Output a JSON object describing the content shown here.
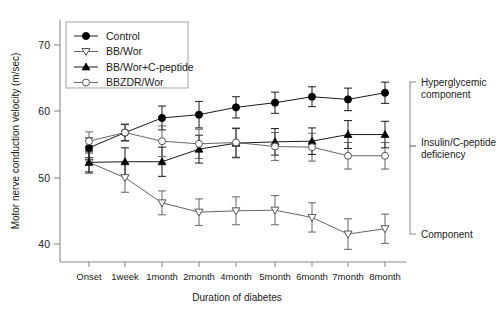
{
  "chart_data": {
    "type": "line",
    "title": "",
    "xlabel": "Duration of diabetes",
    "ylabel": "Motor nerve conduction velocity (m/sec)",
    "categories": [
      "Onset",
      "1week",
      "1month",
      "2month",
      "4month",
      "5month",
      "6month",
      "7month",
      "8month"
    ],
    "ylim": [
      36,
      72
    ],
    "yticks": [
      40,
      50,
      60,
      70
    ],
    "grid": false,
    "legend_position": "top-left",
    "error_type": "error bars (SD)",
    "series": [
      {
        "name": "Control",
        "marker": "filled-circle",
        "color": "#000000",
        "values": [
          54.5,
          56.8,
          59.0,
          59.5,
          60.6,
          61.3,
          62.2,
          61.8,
          62.8
        ],
        "errors": [
          1.5,
          1.2,
          1.8,
          2.0,
          1.6,
          1.6,
          1.5,
          1.7,
          1.6
        ]
      },
      {
        "name": "BB/Wor",
        "marker": "open-triangle-down",
        "color": "#555555",
        "values": [
          52.3,
          50.0,
          46.2,
          44.8,
          45.0,
          45.1,
          44.0,
          41.5,
          42.3
        ],
        "errors": [
          1.4,
          2.2,
          1.8,
          2.0,
          2.1,
          2.2,
          2.2,
          2.3,
          2.2
        ]
      },
      {
        "name": "BB/Wor+C-peptide",
        "marker": "filled-triangle-up",
        "color": "#000000",
        "values": [
          52.3,
          52.4,
          52.4,
          54.3,
          55.2,
          55.4,
          55.5,
          56.5,
          56.5
        ],
        "errors": [
          1.6,
          2.1,
          2.2,
          2.1,
          2.2,
          2.0,
          2.0,
          2.1,
          2.0
        ]
      },
      {
        "name": "BBZDR/Wor",
        "marker": "open-circle",
        "color": "#555555",
        "values": [
          55.5,
          56.8,
          55.5,
          55.1,
          55.3,
          54.7,
          54.6,
          53.3,
          53.3
        ],
        "errors": [
          1.4,
          1.3,
          2.3,
          2.2,
          2.2,
          2.1,
          2.1,
          2.0,
          2.0
        ]
      }
    ],
    "annotations": [
      {
        "label": "Hyperglycemic\ncomponent",
        "line1": "Hyperglycemic",
        "line2": "component"
      },
      {
        "label": "Insulin/C-peptide\ndeficiency",
        "line1": "Insulin/C-peptide",
        "line2": "deficiency"
      },
      {
        "label": "Component",
        "line1": "Component",
        "line2": ""
      }
    ]
  }
}
